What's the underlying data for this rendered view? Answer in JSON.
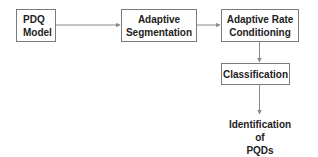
{
  "diagram": {
    "type": "flowchart",
    "nodes": [
      {
        "id": "pdq_model",
        "lines": [
          "PDQ",
          "Model"
        ]
      },
      {
        "id": "adaptive_segmentation",
        "lines": [
          "Adaptive",
          "Segmentation"
        ]
      },
      {
        "id": "adaptive_rate_conditioning",
        "lines": [
          "Adaptive Rate",
          "Conditioning"
        ]
      },
      {
        "id": "classification",
        "lines": [
          "Classification"
        ]
      },
      {
        "id": "identification_of_pqds",
        "lines": [
          "Identification",
          "of",
          "PQDs"
        ]
      }
    ],
    "edges": [
      {
        "from": "pdq_model",
        "to": "adaptive_segmentation"
      },
      {
        "from": "adaptive_segmentation",
        "to": "adaptive_rate_conditioning"
      },
      {
        "from": "adaptive_rate_conditioning",
        "to": "classification"
      },
      {
        "from": "classification",
        "to": "identification_of_pqds"
      }
    ],
    "colors": {
      "border": "#7a7a7a",
      "arrow": "#8a8a8a",
      "text": "#222222"
    }
  }
}
